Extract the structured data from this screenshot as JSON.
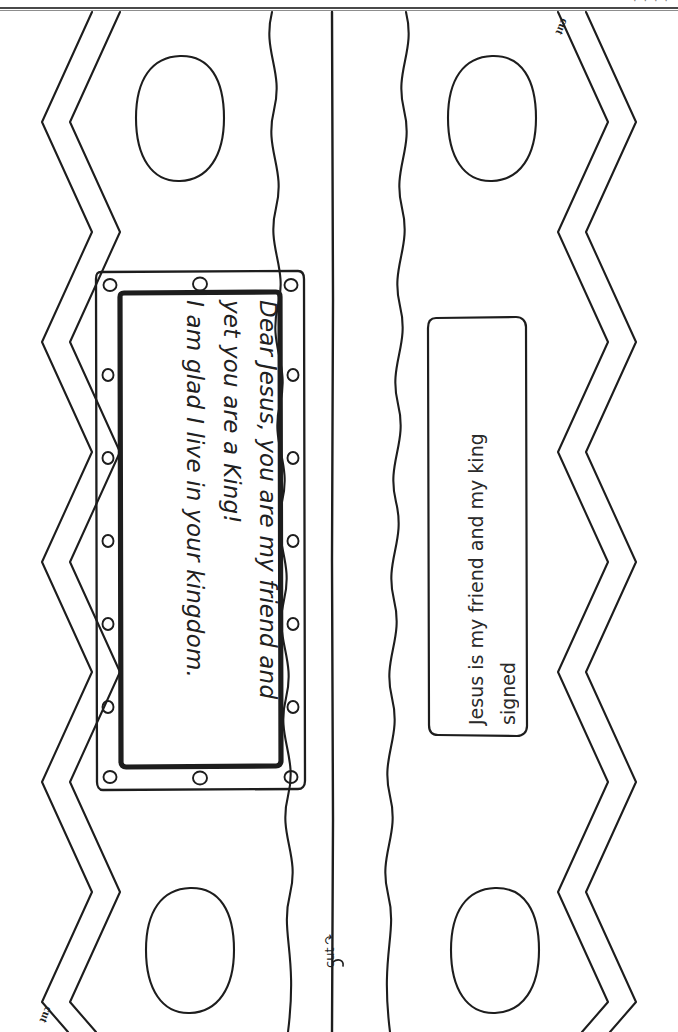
{
  "page": {
    "orientation": "landscape-content-on-portrait-sheet",
    "background": "#ffffff",
    "ink_color": "#1a1a1a",
    "top_fragment": "· · · ·"
  },
  "prayer_card": {
    "name": "prayer-card",
    "lines": [
      "Dear Jesus, you are my friend and",
      "yet you are a King!",
      "I am glad I live in your kingdom."
    ],
    "rivet_count": 12,
    "border_style": "double-frame-with-rivets"
  },
  "signature_card": {
    "name": "signature-card",
    "lines": [
      "Jesus is my friend and my king",
      "signed"
    ],
    "border_style": "rounded-rectangle"
  },
  "cut_labels": [
    {
      "id": "cut-top-right",
      "text": "cut"
    },
    {
      "id": "cut-bottom-left",
      "text": "cut"
    },
    {
      "id": "cut-center",
      "text": "cut",
      "arrow": "↷"
    }
  ],
  "crown_shapes": {
    "zigzag_edges": 2,
    "wavy_bands": 2,
    "jewel_circles": 4,
    "center_fold_line": true
  }
}
